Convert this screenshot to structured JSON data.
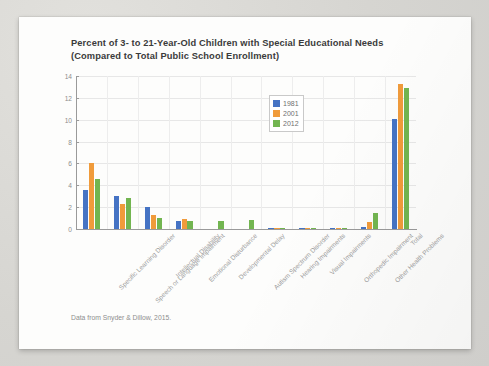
{
  "figure": {
    "title_line1": "Percent of 3- to 21-Year-Old Children with Special Educational Needs",
    "title_line2": "(Compared to Total Public School Enrollment)",
    "source_note": "Data from Snyder & Dillow, 2015."
  },
  "legend": {
    "position": "top-center-right",
    "entries": [
      {
        "label": "1981",
        "color": "#4573c4"
      },
      {
        "label": "2001",
        "color": "#f09b3b"
      },
      {
        "label": "2012",
        "color": "#72b550"
      }
    ]
  },
  "chart_data": {
    "type": "bar",
    "title": "Percent of 3- to 21-Year-Old Children with Special Educational Needs (Compared to Total Public School Enrollment)",
    "xlabel": "",
    "ylabel": "",
    "ylim": [
      0,
      14
    ],
    "yticks": [
      0,
      2,
      4,
      6,
      8,
      10,
      12,
      14
    ],
    "ytick_labels": [
      "0",
      "2",
      "4",
      "6",
      "8",
      "10",
      "12",
      "14"
    ],
    "grid": true,
    "legend_position": "upper center",
    "categories": [
      "Specific Learning Disorder",
      "Speech or Language Impairment",
      "Intellectual Disability",
      "Emotional Disturbance",
      "Developmental Delay",
      "Autism Spectrum Disorder",
      "Hearing Impairments",
      "Visual Impairments",
      "Orthopedic Impairment",
      "Other Health Problems",
      "Total"
    ],
    "series": [
      {
        "name": "1981",
        "color": "#4573c4",
        "values": [
          3.6,
          3.0,
          2.0,
          0.7,
          0.0,
          0.0,
          0.1,
          0.1,
          0.1,
          0.2,
          10.1
        ]
      },
      {
        "name": "2001",
        "color": "#f09b3b",
        "values": [
          6.0,
          2.3,
          1.3,
          0.9,
          0.0,
          0.0,
          0.1,
          0.1,
          0.1,
          0.6,
          13.3
        ]
      },
      {
        "name": "2012",
        "color": "#72b550",
        "values": [
          4.6,
          2.8,
          1.0,
          0.7,
          0.7,
          0.8,
          0.1,
          0.1,
          0.1,
          1.5,
          12.9
        ]
      }
    ]
  }
}
